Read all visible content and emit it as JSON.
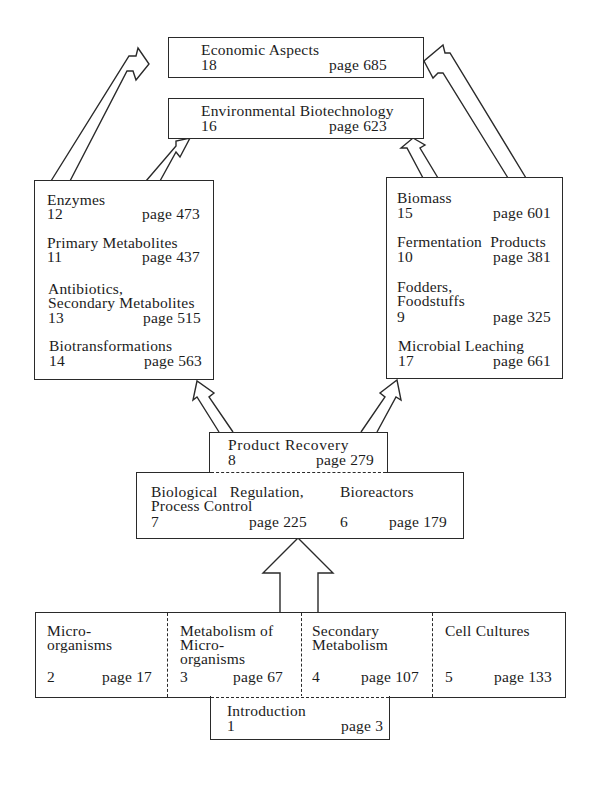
{
  "diagram": {
    "top": {
      "economic": {
        "title": "Economic Aspects",
        "chapter": "18",
        "page": "page 685"
      },
      "environmental": {
        "title": "Environmental Biotechnology",
        "chapter": "16",
        "page": "page 623"
      }
    },
    "left_group": {
      "items": [
        {
          "title": "Enzymes",
          "chapter": "12",
          "page": "page 473"
        },
        {
          "title": "Primary Metabolites",
          "chapter": "11",
          "page": "page 437"
        },
        {
          "title_line1": "Antibiotics,",
          "title_line2": "Secondary Metabolites",
          "chapter": "13",
          "page": "page 515"
        },
        {
          "title": "Biotransformations",
          "chapter": "14",
          "page": "page 563"
        }
      ]
    },
    "right_group": {
      "items": [
        {
          "title": "Biomass",
          "chapter": "15",
          "page": "page 601"
        },
        {
          "title": "Fermentation  Products",
          "chapter": "10",
          "page": "page 381"
        },
        {
          "title_line1": "Fodders,",
          "title_line2": "Foodstuffs",
          "chapter": "9",
          "page": "page 325"
        },
        {
          "title": "Microbial Leaching",
          "chapter": "17",
          "page": "page 661"
        }
      ]
    },
    "middle": {
      "product_recovery": {
        "title": "Product Recovery",
        "chapter": "8",
        "page": "page 279"
      },
      "regulation": {
        "title_line1": "Biological   Regulation,",
        "title_line2": "Process Control",
        "chapter": "7",
        "page": "page 225"
      },
      "bioreactors": {
        "title": "Bioreactors",
        "chapter": "6",
        "page": "page 179"
      }
    },
    "bottom": {
      "cells": [
        {
          "title_line1": "Micro-",
          "title_line2": "organisms",
          "title_line3": "",
          "chapter": "2",
          "page": "page 17"
        },
        {
          "title_line1": "Metabolism of",
          "title_line2": "Micro-",
          "title_line3": "organisms",
          "chapter": "3",
          "page": "page 67"
        },
        {
          "title_line1": "Secondary",
          "title_line2": "Metabolism",
          "title_line3": "",
          "chapter": "4",
          "page": "page 107"
        },
        {
          "title_line1": "Cell Cultures",
          "title_line2": "",
          "title_line3": "",
          "chapter": "5",
          "page": "page 133"
        }
      ],
      "introduction": {
        "title": "Introduction",
        "chapter": "1",
        "page": "page 3"
      }
    },
    "colors": {
      "line": "#2a2a2a",
      "text": "#1c1c1c",
      "background": "#ffffff"
    }
  }
}
